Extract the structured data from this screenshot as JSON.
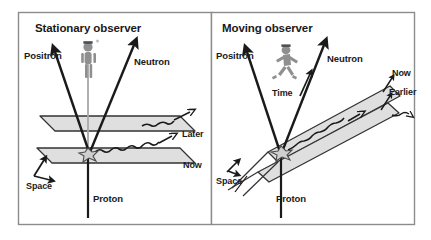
{
  "figure": {
    "kind": "physics-diagram",
    "panel_count": 2
  },
  "colors": {
    "border": "#8c8c8c",
    "ink": "#1a1a1a",
    "plane_fill": "#d9d9d9",
    "plane_stroke": "#333333",
    "figure_fill": "#9a9a9a",
    "background": "#ffffff"
  },
  "panels": [
    {
      "id": "stationary",
      "title": "Stationary observer",
      "observer_icon": "standing-person-icon",
      "arrows": [
        {
          "name": "positron",
          "label": "Positron"
        },
        {
          "name": "neutron",
          "label": "Neutron"
        },
        {
          "name": "proton",
          "label": "Proton"
        },
        {
          "name": "neutrino",
          "label": ""
        }
      ],
      "axis_labels": [
        {
          "name": "space",
          "label": "Space"
        }
      ],
      "planes": [
        {
          "name": "later-plane",
          "label": "Later"
        },
        {
          "name": "now-plane",
          "label": "Now"
        }
      ]
    },
    {
      "id": "moving",
      "title": "Moving observer",
      "observer_icon": "running-person-icon",
      "arrows": [
        {
          "name": "positron",
          "label": "Positron"
        },
        {
          "name": "neutron",
          "label": "Neutron"
        },
        {
          "name": "proton",
          "label": "Proton"
        },
        {
          "name": "time",
          "label": "Time"
        },
        {
          "name": "neutrino",
          "label": ""
        }
      ],
      "axis_labels": [
        {
          "name": "space",
          "label": "Space"
        }
      ],
      "planes": [
        {
          "name": "now-plane",
          "label": "Now"
        },
        {
          "name": "earlier-plane",
          "label": "Earlier"
        }
      ]
    }
  ],
  "labels": {
    "left_title": "Stationary observer",
    "left_positron": "Positron",
    "left_neutron": "Neutron",
    "left_proton": "Proton",
    "left_space": "Space",
    "left_later": "Later",
    "left_now": "Now",
    "right_title": "Moving observer",
    "right_positron": "Positron",
    "right_neutron": "Neutron",
    "right_proton": "Proton",
    "right_time": "Time",
    "right_space": "Space",
    "right_now": "Now",
    "right_earlier": "Earlier"
  }
}
